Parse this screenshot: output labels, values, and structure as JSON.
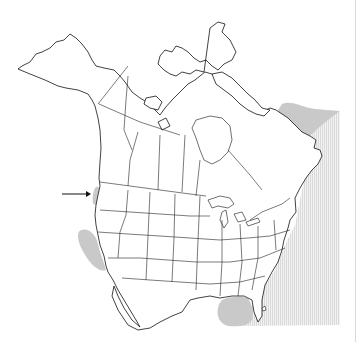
{
  "map": {
    "type": "species-range-map",
    "region": "North America",
    "colors": {
      "background": "#ffffff",
      "outline": "#111111",
      "range_fill": "#c9c9c9",
      "hatch": "#d9d9d9"
    },
    "ranges": [
      {
        "name": "labrador-sea-range",
        "style": "solid"
      },
      {
        "name": "washington-coast-range",
        "style": "solid"
      },
      {
        "name": "california-coast-range",
        "style": "solid"
      },
      {
        "name": "gulf-of-mexico-range",
        "style": "solid"
      },
      {
        "name": "western-atlantic-range",
        "style": "hatched"
      }
    ],
    "arrow": {
      "direction": "right",
      "points_to": "washington-coast-range"
    }
  }
}
